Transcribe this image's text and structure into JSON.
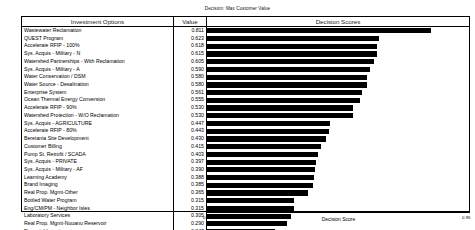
{
  "chart": {
    "title": "Decision: Max Customer Value"
  },
  "table": {
    "headers": {
      "options": "Investment Options",
      "value": "Value",
      "scores": "Decision Scores"
    }
  },
  "axis": {
    "label": "Decision Score",
    "min_label": "0.00",
    "max_label": "0.95"
  },
  "chart_data": {
    "type": "bar",
    "orientation": "horizontal",
    "title": "Decision: Max Customer Value",
    "xlabel": "Decision Score",
    "ylabel": "Investment Options",
    "xlim": [
      0.0,
      0.95
    ],
    "grid": false,
    "legend": false,
    "bar_color": "#000000",
    "categories": [
      "Wastewater Reclamation",
      "QUEST Program",
      "Accelerate RFIP - 100%",
      "Sys. Acquis - Military - N",
      "Watershed Partnerships - With Reclamation",
      "Sys. Acquis - Military - A",
      "Water Conservation / DSM",
      "Water Source - Desalination",
      "Enterprise System",
      "Ocean Thermal Energy Conversion",
      "Accelerate RFIP - 90%",
      "Watershed Protection - W/O Reclamation",
      "Sys. Acquis - AGRICULTURE",
      "Accelerate RFIP - 80%",
      "Beretania Site Development",
      "Customer Billing",
      "Pump St. Retrofit / SCADA",
      "Sys. Acquis - PRIVATE",
      "Sys. Acquis - Military - AF",
      "Learning Academy",
      "Brand Imaging",
      "Real Prop. Mgmt-Other",
      "Bottled Water Program",
      "Eng/CM/PM - Neighbor Isles",
      "Laboratory Services",
      "Real Prop. Mgmt-Nuuanu Reservoir",
      "Financial Investments"
    ],
    "values": [
      0.811,
      0.623,
      0.618,
      0.615,
      0.605,
      0.59,
      0.58,
      0.58,
      0.561,
      0.555,
      0.53,
      0.53,
      0.447,
      0.443,
      0.43,
      0.415,
      0.403,
      0.397,
      0.39,
      0.388,
      0.385,
      0.365,
      0.315,
      0.315,
      0.305,
      0.29,
      0.247
    ]
  }
}
